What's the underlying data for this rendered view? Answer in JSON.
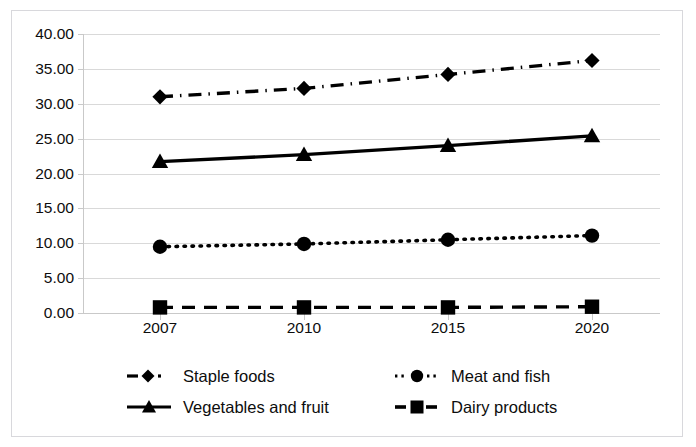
{
  "chart_data": {
    "type": "line",
    "title": "",
    "xlabel": "",
    "ylabel": "",
    "categories": [
      "2007",
      "2010",
      "2015",
      "2020"
    ],
    "ylim": [
      0,
      40
    ],
    "ytick_step": 5,
    "ytick_labels": [
      "40.00",
      "35.00",
      "30.00",
      "25.00",
      "20.00",
      "15.00",
      "10.00",
      "5.00",
      "0.00"
    ],
    "ytick_values": [
      40,
      35,
      30,
      25,
      20,
      15,
      10,
      5,
      0
    ],
    "grid": true,
    "legend_position": "bottom",
    "series": [
      {
        "name": "Staple foods",
        "values": [
          31.0,
          32.2,
          34.2,
          36.2
        ],
        "marker": "diamond",
        "dash": "dashdot",
        "color": "#000000"
      },
      {
        "name": "Meat and fish",
        "values": [
          9.5,
          9.9,
          10.5,
          11.1
        ],
        "marker": "circle",
        "dash": "dotted",
        "color": "#000000"
      },
      {
        "name": "Vegetables and fruit",
        "values": [
          21.7,
          22.7,
          24.0,
          25.4
        ],
        "marker": "triangle",
        "dash": "solid",
        "color": "#000000"
      },
      {
        "name": "Dairy products",
        "values": [
          0.8,
          0.8,
          0.8,
          0.9
        ],
        "marker": "square",
        "dash": "dashed",
        "color": "#000000"
      }
    ]
  },
  "legend": {
    "items": [
      {
        "label": "Staple foods",
        "marker": "diamond-marker",
        "dash": "dashdot"
      },
      {
        "label": "Meat and fish",
        "marker": "circle-marker",
        "dash": "dotted"
      },
      {
        "label": "Vegetables and fruit",
        "marker": "triangle-marker",
        "dash": "solid"
      },
      {
        "label": "Dairy products",
        "marker": "square-marker",
        "dash": "dashed"
      }
    ]
  },
  "colors": {
    "series": "#000000",
    "gridline": "#d9d9d9",
    "axis": "#c9c9c9",
    "frame": "#d8d8dc",
    "text": "#0d0d0d",
    "background": "#ffffff"
  }
}
